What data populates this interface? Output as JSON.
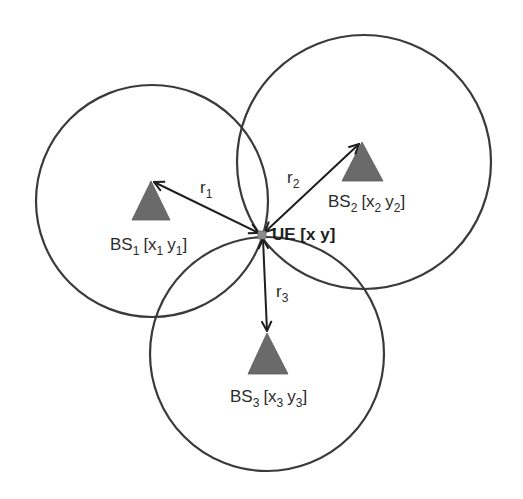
{
  "diagram": {
    "type": "trilateration",
    "colors": {
      "circle_stroke": "#3a3a3a",
      "triangle_fill": "#6a6a6a",
      "arrow_stroke": "#1e1e1e",
      "ue_fill": "#8c8c8c",
      "background": "#ffffff"
    },
    "ue": {
      "label_main": "UE [x y]",
      "x": 262,
      "y": 235
    },
    "base_stations": [
      {
        "id": "BS1",
        "prefix": "BS",
        "index": "1",
        "coord_x": "x",
        "coord_y": "y",
        "circle": {
          "cx": 152,
          "cy": 201,
          "r": 116
        },
        "triangle": {
          "apex": [
            151,
            181
          ],
          "base_left": [
            132,
            220
          ],
          "base_right": [
            170,
            220
          ]
        },
        "label_pos": [
          110,
          250
        ],
        "range_label": {
          "letter": "r",
          "index": "1",
          "x": 200,
          "y": 193
        }
      },
      {
        "id": "BS2",
        "prefix": "BS",
        "index": "2",
        "coord_x": "x",
        "coord_y": "y",
        "circle": {
          "cx": 364,
          "cy": 162,
          "r": 127
        },
        "triangle": {
          "apex": [
            362,
            142
          ],
          "base_left": [
            342,
            181
          ],
          "base_right": [
            383,
            181
          ]
        },
        "label_pos": [
          328,
          207
        ],
        "range_label": {
          "letter": "r",
          "index": "2",
          "x": 287,
          "y": 183
        }
      },
      {
        "id": "BS3",
        "prefix": "BS",
        "index": "3",
        "coord_x": "x",
        "coord_y": "y",
        "circle": {
          "cx": 267,
          "cy": 354,
          "r": 117
        },
        "triangle": {
          "apex": [
            267,
            333
          ],
          "base_left": [
            248,
            374
          ],
          "base_right": [
            288,
            374
          ]
        },
        "label_pos": [
          230,
          402
        ],
        "range_label": {
          "letter": "r",
          "index": "3",
          "x": 276,
          "y": 297
        }
      }
    ],
    "text": {
      "bs_prefix": "BS",
      "open_bracket": "[",
      "close_bracket": "]",
      "x_var": "x",
      "y_var": "y",
      "space": " ",
      "r_letter": "r",
      "sub1": "1",
      "sub2": "2",
      "sub3": "3",
      "ue_label": "UE [x y]"
    }
  }
}
